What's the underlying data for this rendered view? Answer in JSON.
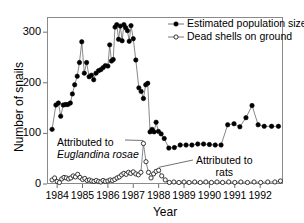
{
  "chart_data": {
    "type": "line",
    "title": "",
    "xlabel": "Year",
    "ylabel": "Number of snails",
    "xlim": [
      1983.6,
      1992.9
    ],
    "ylim": [
      0,
      330
    ],
    "yticks": [
      0,
      100,
      200,
      300
    ],
    "xticks": [
      1984,
      1985,
      1986,
      1987,
      1988,
      1989,
      1990,
      1991,
      1992
    ],
    "grid": false,
    "legend_position": "top-right",
    "series": [
      {
        "name": "Estimated population size",
        "marker": "filled-circle",
        "color": "#000000",
        "points": [
          [
            1983.8,
            108
          ],
          [
            1983.95,
            156
          ],
          [
            1984.05,
            160
          ],
          [
            1984.14,
            134
          ],
          [
            1984.24,
            156
          ],
          [
            1984.33,
            157
          ],
          [
            1984.42,
            157
          ],
          [
            1984.52,
            160
          ],
          [
            1984.6,
            178
          ],
          [
            1984.69,
            196
          ],
          [
            1984.79,
            213
          ],
          [
            1984.88,
            240
          ],
          [
            1984.97,
            281
          ],
          [
            1985.07,
            219
          ],
          [
            1985.16,
            240
          ],
          [
            1985.26,
            212
          ],
          [
            1985.35,
            215
          ],
          [
            1985.44,
            206
          ],
          [
            1985.53,
            219
          ],
          [
            1985.63,
            224
          ],
          [
            1985.72,
            226
          ],
          [
            1985.81,
            230
          ],
          [
            1985.9,
            234
          ],
          [
            1986.0,
            233
          ],
          [
            1986.07,
            275
          ],
          [
            1986.14,
            243
          ],
          [
            1986.21,
            246
          ],
          [
            1986.28,
            310
          ],
          [
            1986.35,
            315
          ],
          [
            1986.42,
            286
          ],
          [
            1986.49,
            312
          ],
          [
            1986.56,
            283
          ],
          [
            1986.63,
            315
          ],
          [
            1986.7,
            309
          ],
          [
            1986.77,
            303
          ],
          [
            1986.84,
            282
          ],
          [
            1986.91,
            313
          ],
          [
            1987.0,
            287
          ],
          [
            1987.1,
            245
          ],
          [
            1987.22,
            190
          ],
          [
            1987.31,
            183
          ],
          [
            1987.4,
            169
          ],
          [
            1987.49,
            196
          ],
          [
            1987.57,
            199
          ],
          [
            1987.66,
            103
          ],
          [
            1987.74,
            108
          ],
          [
            1987.82,
            103
          ],
          [
            1987.9,
            122
          ],
          [
            1987.99,
            104
          ],
          [
            1988.1,
            99
          ],
          [
            1988.22,
            90
          ],
          [
            1988.4,
            71
          ],
          [
            1988.62,
            72
          ],
          [
            1988.85,
            77
          ],
          [
            1989.08,
            77
          ],
          [
            1989.31,
            77
          ],
          [
            1989.54,
            79
          ],
          [
            1989.77,
            79
          ],
          [
            1990.0,
            78
          ],
          [
            1990.23,
            77
          ],
          [
            1990.46,
            77
          ],
          [
            1990.72,
            117
          ],
          [
            1990.97,
            119
          ],
          [
            1991.2,
            113
          ],
          [
            1991.44,
            131
          ],
          [
            1991.68,
            155
          ],
          [
            1991.92,
            117
          ],
          [
            1992.16,
            114
          ],
          [
            1992.45,
            114
          ],
          [
            1992.72,
            114
          ]
        ]
      },
      {
        "name": "Dead shells on ground",
        "marker": "open-circle",
        "color": "#000000",
        "points": [
          [
            1983.8,
            8
          ],
          [
            1983.9,
            12
          ],
          [
            1984.0,
            5
          ],
          [
            1984.09,
            3
          ],
          [
            1984.18,
            10
          ],
          [
            1984.27,
            13
          ],
          [
            1984.36,
            12
          ],
          [
            1984.45,
            10
          ],
          [
            1984.54,
            12
          ],
          [
            1984.63,
            16
          ],
          [
            1984.72,
            14
          ],
          [
            1984.81,
            19
          ],
          [
            1984.9,
            13
          ],
          [
            1985.0,
            9
          ],
          [
            1985.09,
            11
          ],
          [
            1985.18,
            7
          ],
          [
            1985.27,
            8
          ],
          [
            1985.36,
            6
          ],
          [
            1985.45,
            5
          ],
          [
            1985.54,
            7
          ],
          [
            1985.63,
            5
          ],
          [
            1985.72,
            4
          ],
          [
            1985.81,
            7
          ],
          [
            1985.9,
            5
          ],
          [
            1986.0,
            6
          ],
          [
            1986.09,
            8
          ],
          [
            1986.18,
            7
          ],
          [
            1986.27,
            9
          ],
          [
            1986.36,
            12
          ],
          [
            1986.45,
            14
          ],
          [
            1986.54,
            18
          ],
          [
            1986.63,
            21
          ],
          [
            1986.72,
            19
          ],
          [
            1986.81,
            23
          ],
          [
            1986.9,
            21
          ],
          [
            1987.0,
            24
          ],
          [
            1987.1,
            20
          ],
          [
            1987.2,
            18
          ],
          [
            1987.3,
            23
          ],
          [
            1987.4,
            80
          ],
          [
            1987.5,
            44
          ],
          [
            1987.6,
            23
          ],
          [
            1987.7,
            12
          ],
          [
            1987.8,
            20
          ],
          [
            1987.9,
            25
          ],
          [
            1988.0,
            27
          ],
          [
            1988.12,
            16
          ],
          [
            1988.26,
            8
          ],
          [
            1988.42,
            3
          ],
          [
            1988.6,
            4
          ],
          [
            1988.8,
            3
          ],
          [
            1989.0,
            4
          ],
          [
            1989.2,
            3
          ],
          [
            1989.42,
            4
          ],
          [
            1989.64,
            3
          ],
          [
            1989.86,
            4
          ],
          [
            1990.08,
            3
          ],
          [
            1990.3,
            4
          ],
          [
            1990.52,
            3
          ],
          [
            1990.76,
            4
          ],
          [
            1991.0,
            3
          ],
          [
            1991.24,
            4
          ],
          [
            1991.5,
            3
          ],
          [
            1991.76,
            4
          ],
          [
            1992.02,
            3
          ],
          [
            1992.3,
            4
          ],
          [
            1992.58,
            4
          ],
          [
            1992.8,
            6
          ]
        ]
      }
    ],
    "annotations": [
      {
        "id": "euglandina",
        "line1": "Attributed to",
        "line2": "Euglandina rosae",
        "line2_italic": true,
        "target_x": 1987.4,
        "target_y": 80
      },
      {
        "id": "rats",
        "line1": "Attributed to",
        "line2": "rats",
        "line2_italic": false,
        "target_x": 1988.0,
        "target_y": 27
      }
    ]
  }
}
